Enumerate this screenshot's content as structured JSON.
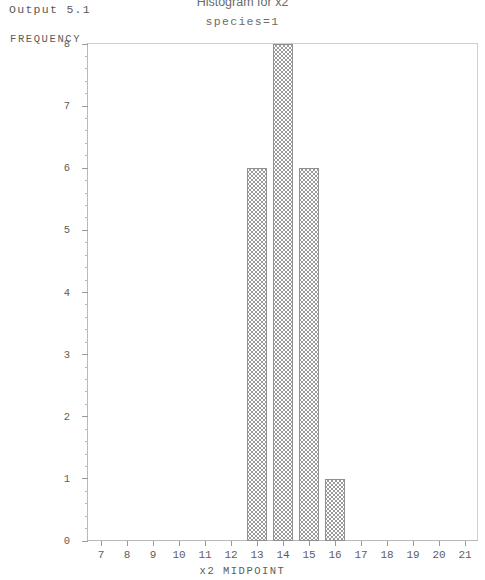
{
  "output_label": "Output 5.1",
  "chart_data": {
    "type": "bar",
    "title": "Histogram for x2",
    "subtitle": "species=1",
    "xlabel": "x2 MIDPOINT",
    "ylabel": "FREQUENCY",
    "categories": [
      13,
      14,
      15,
      16
    ],
    "values": [
      6,
      8,
      6,
      1
    ],
    "xlim": [
      6.5,
      21.5
    ],
    "ylim": [
      0,
      8
    ],
    "xticks": [
      7,
      8,
      9,
      10,
      11,
      12,
      13,
      14,
      15,
      16,
      17,
      18,
      19,
      20,
      21
    ],
    "xtick_labels": [
      "7",
      "8",
      "9",
      "10",
      "11",
      "12",
      "13",
      "14",
      "15",
      "16",
      "17",
      "18",
      "19",
      "20",
      "21"
    ],
    "yticks": [
      0,
      1,
      2,
      3,
      4,
      5,
      6,
      7,
      8
    ],
    "ytick_labels": [
      "0",
      "1",
      "2",
      "3",
      "4",
      "5",
      "6",
      "7",
      "8"
    ],
    "y_minor_per_major": 5,
    "grid": false,
    "legend": null,
    "bar_fill": "crosshatch",
    "bar_edge_color": "#8f8f8f",
    "bar_pattern_color": "#9b9b9b",
    "axis_color": "#9a9a9a",
    "text_color": "#5d5d5d"
  }
}
